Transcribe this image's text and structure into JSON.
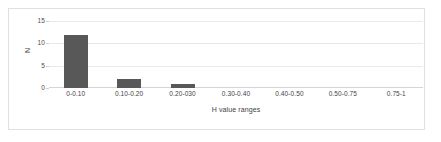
{
  "figure": {
    "border_color": "#e0e0e0",
    "background": "#ffffff"
  },
  "chart_data": {
    "type": "bar",
    "title": "",
    "subtitle": "",
    "xlabel": "H value ranges",
    "ylabel": "N",
    "categories": [
      "0-0.10",
      "0.10-0.20",
      "0.20-030",
      "0.30-0.40",
      "0.40-0.50",
      "0.50-0.75",
      "0.75-1"
    ],
    "values": [
      12,
      2,
      1,
      0,
      0,
      0,
      0
    ],
    "ylim": [
      0,
      15
    ],
    "yticks": [
      0,
      5,
      10,
      15
    ],
    "ytick_labels": [
      "0",
      "5",
      "10",
      "15"
    ],
    "grid": true,
    "grid_axis": "y",
    "grid_color": "#e9e9e9",
    "legend": false,
    "legend_position": "none",
    "bar_color": "#585858",
    "axis_line_color": "#d5d5d5",
    "series": [
      {
        "name": "N",
        "values": [
          12,
          2,
          1,
          0,
          0,
          0,
          0
        ]
      }
    ]
  }
}
